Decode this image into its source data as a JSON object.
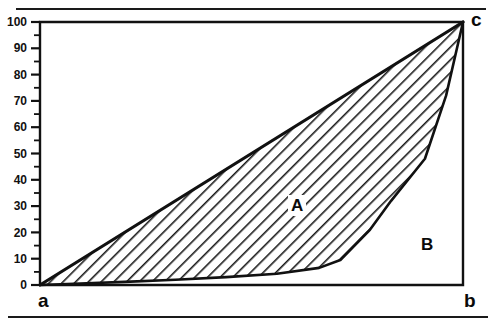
{
  "figure": {
    "title_visible": false,
    "point_labels": {
      "origin": "a",
      "x_end": "b",
      "top_right": "c"
    },
    "region_labels": {
      "inequality_area": "A",
      "under_curve_area": "B"
    },
    "colors": {
      "line": "#111111",
      "hatch": "#1a1a1a",
      "background": "#ffffff"
    }
  },
  "chart_data": {
    "type": "line",
    "title": "",
    "xlabel": "",
    "ylabel": "",
    "xlim": [
      0,
      100
    ],
    "ylim": [
      0,
      100
    ],
    "grid": false,
    "legend": null,
    "y_ticks": [
      0,
      10,
      20,
      30,
      40,
      50,
      60,
      70,
      80,
      90,
      100
    ],
    "y_tick_labels": [
      "0",
      "10",
      "20",
      "30",
      "40",
      "50",
      "60",
      "70",
      "80",
      "90",
      "100"
    ],
    "y_minor_ticks": [
      5,
      15,
      25,
      35,
      45,
      55,
      65,
      75,
      85,
      95
    ],
    "x_ticks": [],
    "x_tick_labels": [],
    "series": [
      {
        "name": "line of equality",
        "style": "straight",
        "x": [
          0,
          100
        ],
        "y": [
          0,
          100
        ]
      },
      {
        "name": "lorenz curve",
        "style": "piecewise",
        "x": [
          0,
          8,
          20,
          32,
          44,
          56,
          66,
          71,
          78,
          83,
          91,
          96,
          100
        ],
        "y": [
          0,
          0.5,
          1.2,
          2.0,
          3.0,
          4.3,
          6.5,
          9.5,
          21,
          32,
          48,
          72,
          100
        ]
      }
    ],
    "annotations": [
      {
        "text": "A",
        "x": 60,
        "y": 31
      },
      {
        "text": "B",
        "x": 91,
        "y": 16
      },
      {
        "text": "a",
        "x": 0,
        "y": -8
      },
      {
        "text": "b",
        "x": 100,
        "y": -8
      },
      {
        "text": "c",
        "x": 103,
        "y": 100
      }
    ]
  }
}
